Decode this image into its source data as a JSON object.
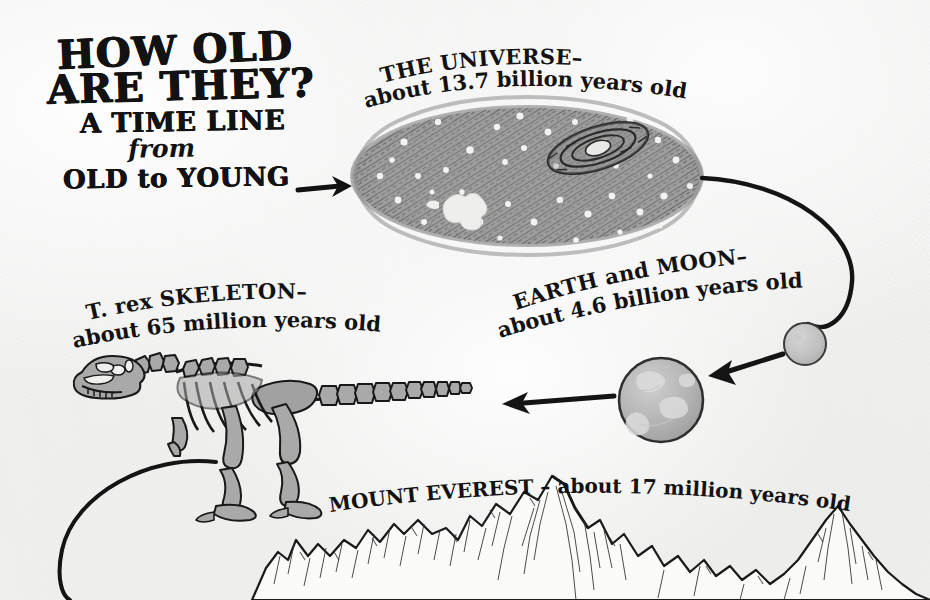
{
  "poster": {
    "title_lines": [
      "HOW OLD",
      "ARE THEY?",
      "A TIME LINE",
      "from",
      "OLD to YOUNG"
    ],
    "background_color": "#f1f1f0",
    "ink_color": "#121212"
  },
  "entries": [
    {
      "id": "universe",
      "name_caps": "THE UNIVERSE–",
      "age_text": "about 13.7 billion years old",
      "full_label": "THE UNIVERSE – about 13.7 billion years old",
      "age_value": 13.7,
      "age_unit": "billion years",
      "illustration": "galaxy-cloud",
      "fill_color": "#9a9a9a"
    },
    {
      "id": "earth-and-moon",
      "name_caps": "EARTH and MOON–",
      "age_text": "about 4.6 billion years old",
      "full_label": "EARTH and MOON – about 4.6 billion years old",
      "age_value": 4.6,
      "age_unit": "billion years",
      "illustration": "earth-and-moon",
      "fill_color": "#b0b0b0"
    },
    {
      "id": "t-rex-skeleton",
      "name_caps": "T. rex SKELETON–",
      "age_text": "about 65 million years old",
      "full_label": "T. rex SKELETON – about 65 million years old",
      "age_value": 65,
      "age_unit": "million years",
      "illustration": "tyrannosaurus-skeleton",
      "fill_color": "#a8a8a8"
    },
    {
      "id": "mount-everest",
      "name_caps": "MOUNT EVEREST –",
      "age_text": "about 17 million years old",
      "full_label": "MOUNT EVEREST – about 17 million years old",
      "age_value": 17,
      "age_unit": "million years",
      "illustration": "mountain-range",
      "fill_color": "#ffffff"
    }
  ],
  "connectors": [
    {
      "id": "title-to-universe",
      "kind": "straight-arrow",
      "direction": "right"
    },
    {
      "id": "universe-to-moon",
      "kind": "curved-line",
      "direction": "clockwise-down"
    },
    {
      "id": "moon-to-earth",
      "kind": "straight-arrow",
      "direction": "left"
    },
    {
      "id": "earth-to-trex",
      "kind": "straight-arrow",
      "direction": "left"
    },
    {
      "id": "trex-to-everest",
      "kind": "curved-line",
      "direction": "counterclockwise-down"
    }
  ]
}
